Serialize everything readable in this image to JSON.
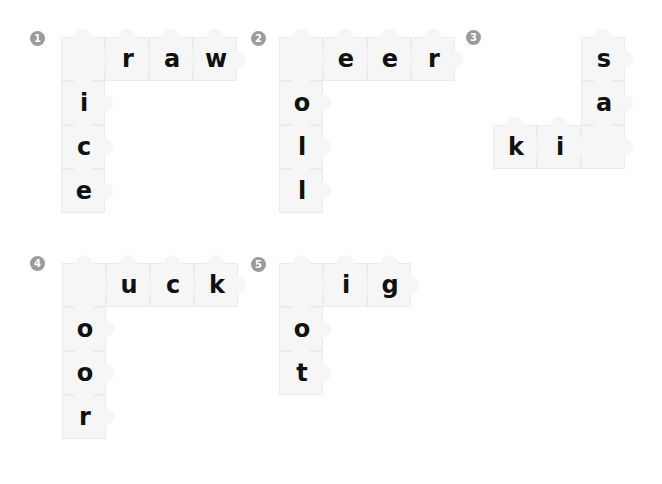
{
  "puzzles": [
    {
      "number": "1",
      "badge": [
        30,
        31
      ],
      "cells": [
        {
          "x": 61,
          "y": 37,
          "l": ""
        },
        {
          "x": 105,
          "y": 37,
          "l": "r"
        },
        {
          "x": 149,
          "y": 37,
          "l": "a"
        },
        {
          "x": 193,
          "y": 37,
          "l": "w"
        },
        {
          "x": 61,
          "y": 81,
          "l": "i"
        },
        {
          "x": 61,
          "y": 125,
          "l": "c"
        },
        {
          "x": 61,
          "y": 169,
          "l": "e"
        }
      ]
    },
    {
      "number": "2",
      "badge": [
        251,
        31
      ],
      "cells": [
        {
          "x": 279,
          "y": 37,
          "l": ""
        },
        {
          "x": 323,
          "y": 37,
          "l": "e"
        },
        {
          "x": 367,
          "y": 37,
          "l": "e"
        },
        {
          "x": 411,
          "y": 37,
          "l": "r"
        },
        {
          "x": 279,
          "y": 81,
          "l": "o"
        },
        {
          "x": 279,
          "y": 125,
          "l": "l"
        },
        {
          "x": 279,
          "y": 169,
          "l": "l"
        }
      ]
    },
    {
      "number": "3",
      "badge": [
        466,
        30
      ],
      "cells": [
        {
          "x": 581,
          "y": 37,
          "l": "s"
        },
        {
          "x": 581,
          "y": 81,
          "l": "a"
        },
        {
          "x": 581,
          "y": 125,
          "l": ""
        },
        {
          "x": 493,
          "y": 125,
          "l": "k"
        },
        {
          "x": 537,
          "y": 125,
          "l": "i"
        }
      ]
    },
    {
      "number": "4",
      "badge": [
        30,
        256
      ],
      "cells": [
        {
          "x": 62,
          "y": 263,
          "l": ""
        },
        {
          "x": 106,
          "y": 263,
          "l": "u"
        },
        {
          "x": 150,
          "y": 263,
          "l": "c"
        },
        {
          "x": 194,
          "y": 263,
          "l": "k"
        },
        {
          "x": 62,
          "y": 307,
          "l": "o"
        },
        {
          "x": 62,
          "y": 351,
          "l": "o"
        },
        {
          "x": 62,
          "y": 395,
          "l": "r"
        }
      ]
    },
    {
      "number": "5",
      "badge": [
        251,
        257
      ],
      "cells": [
        {
          "x": 279,
          "y": 263,
          "l": ""
        },
        {
          "x": 323,
          "y": 263,
          "l": "i"
        },
        {
          "x": 367,
          "y": 263,
          "l": "g"
        },
        {
          "x": 279,
          "y": 307,
          "l": "o"
        },
        {
          "x": 279,
          "y": 351,
          "l": "t"
        }
      ]
    }
  ]
}
